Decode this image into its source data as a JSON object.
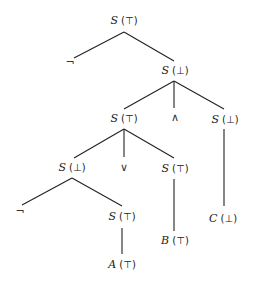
{
  "tree": {
    "nodes": [
      {
        "id": "n0",
        "sym": "S",
        "val": "(⊤)",
        "x": 124,
        "y": 20
      },
      {
        "id": "n1",
        "op": "¬",
        "x": 70,
        "y": 62
      },
      {
        "id": "n2",
        "sym": "S",
        "val": "(⊥)",
        "x": 175,
        "y": 70
      },
      {
        "id": "n3",
        "sym": "S",
        "val": "(⊤)",
        "x": 124,
        "y": 118
      },
      {
        "id": "n4",
        "op": "∧",
        "x": 175,
        "y": 117
      },
      {
        "id": "n5",
        "sym": "S",
        "val": "(⊥)",
        "x": 225,
        "y": 119
      },
      {
        "id": "n6",
        "sym": "S",
        "val": "(⊥)",
        "x": 72,
        "y": 167
      },
      {
        "id": "n7",
        "op": "∨",
        "x": 124,
        "y": 167
      },
      {
        "id": "n8",
        "sym": "S",
        "val": "(⊤)",
        "x": 175,
        "y": 168
      },
      {
        "id": "n9",
        "op": "¬",
        "x": 20,
        "y": 211
      },
      {
        "id": "n10",
        "sym": "S",
        "val": "(⊤)",
        "x": 122,
        "y": 216
      },
      {
        "id": "n11",
        "sym": "C",
        "val": "(⊥)",
        "x": 223,
        "y": 218
      },
      {
        "id": "n12",
        "sym": "B",
        "val": "(⊤)",
        "x": 175,
        "y": 240
      },
      {
        "id": "n13",
        "sym": "A",
        "val": "(⊤)",
        "x": 122,
        "y": 264
      }
    ],
    "edges": [
      [
        124,
        32,
        74,
        58
      ],
      [
        124,
        32,
        174,
        61
      ],
      [
        174,
        81,
        124,
        109
      ],
      [
        174,
        81,
        174,
        108
      ],
      [
        174,
        81,
        224,
        109
      ],
      [
        124,
        129,
        74,
        158
      ],
      [
        124,
        129,
        124,
        157
      ],
      [
        124,
        129,
        174,
        158
      ],
      [
        224,
        129,
        224,
        206
      ],
      [
        72,
        178,
        22,
        205
      ],
      [
        72,
        178,
        122,
        206
      ],
      [
        122,
        228,
        122,
        254
      ],
      [
        174,
        179,
        174,
        231
      ]
    ]
  }
}
